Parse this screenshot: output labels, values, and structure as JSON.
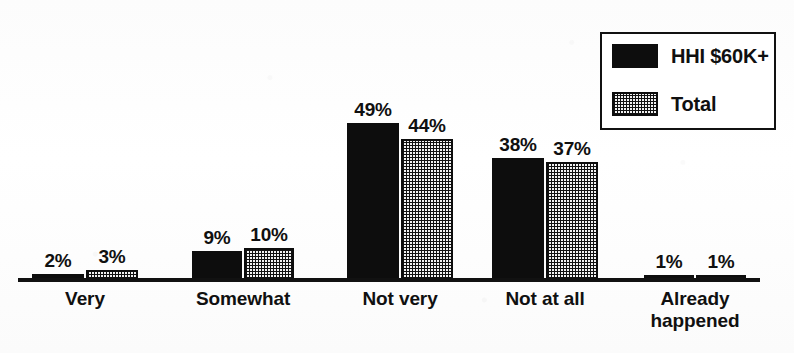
{
  "chart_data": {
    "type": "bar",
    "title": "",
    "xlabel": "",
    "ylabel": "",
    "ylim": [
      0,
      56
    ],
    "grid": false,
    "legend_position": "top-right",
    "categories": [
      "Very",
      "Somewhat",
      "Not very",
      "Not at all",
      "Already\nhappened"
    ],
    "series": [
      {
        "name": "HHI $60K+",
        "fill": "solid-black",
        "color": "#0d0d0d",
        "values": [
          2,
          9,
          49,
          38,
          1
        ],
        "labels": [
          "2%",
          "9%",
          "49%",
          "38%",
          "1%"
        ]
      },
      {
        "name": "Total",
        "fill": "dotted-checker",
        "color": "#f2f2f2",
        "values": [
          3,
          10,
          44,
          37,
          1
        ],
        "labels": [
          "3%",
          "10%",
          "44%",
          "37%",
          "1%"
        ]
      }
    ]
  },
  "legend": {
    "entries": [
      {
        "label": "HHI $60K+",
        "swatch": "solid-black"
      },
      {
        "label": "Total",
        "swatch": "dotted-checker"
      }
    ]
  },
  "axis": {
    "baseline_color": "#111111"
  }
}
